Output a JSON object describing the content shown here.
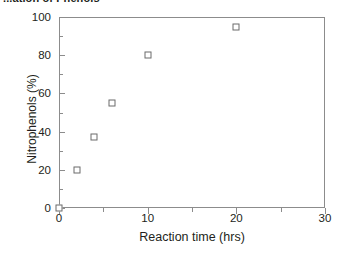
{
  "figure": {
    "caption": "...ation of Phenols",
    "background_color": "#ffffff",
    "frame_color": "#8c8c8c",
    "marker_edge_color": "#6b6b6b",
    "marker_face_color": "#ffffff"
  },
  "chart_data": {
    "type": "scatter",
    "title": "",
    "xlabel": "Reaction time (hrs)",
    "ylabel": "Nitrophenols (%)",
    "xlim": [
      0,
      30
    ],
    "ylim": [
      0,
      100
    ],
    "x_major_ticks": [
      0,
      10,
      20,
      30
    ],
    "x_minor_ticks": [
      5,
      15,
      25
    ],
    "y_major_ticks": [
      0,
      20,
      40,
      60,
      80,
      100
    ],
    "y_minor_ticks": [
      10,
      30,
      50,
      70,
      90
    ],
    "x_tick_labels": [
      "0",
      "10",
      "20",
      "30"
    ],
    "y_tick_labels": [
      "0",
      "20",
      "40",
      "60",
      "80",
      "100"
    ],
    "grid": false,
    "legend": null,
    "marker": "open-square",
    "series": [
      {
        "name": "Nitrophenols",
        "points": [
          {
            "x": 0,
            "y": 0
          },
          {
            "x": 2,
            "y": 20
          },
          {
            "x": 4,
            "y": 37
          },
          {
            "x": 6,
            "y": 55
          },
          {
            "x": 10,
            "y": 80
          },
          {
            "x": 20,
            "y": 95
          }
        ]
      }
    ]
  }
}
